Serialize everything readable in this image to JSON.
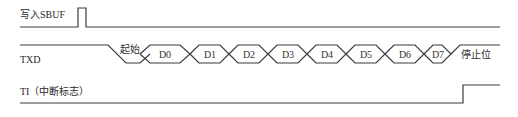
{
  "diagram": {
    "type": "timing-diagram",
    "signals": [
      {
        "id": "sbuf",
        "label": "写入SBUF"
      },
      {
        "id": "txd",
        "label": "TXD"
      },
      {
        "id": "ti",
        "label": "TI（中断标志）"
      }
    ],
    "txd": {
      "start_label": "起始",
      "stop_label": "停止位",
      "bits": [
        "D0",
        "D1",
        "D2",
        "D3",
        "D4",
        "D5",
        "D6",
        "D7"
      ]
    },
    "colors": {
      "line": "#3a3a3a",
      "background": "#ffffff"
    }
  }
}
